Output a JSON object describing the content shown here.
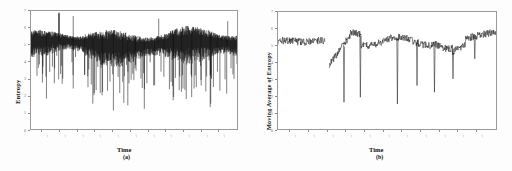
{
  "figure": {
    "background_color": "#ffffff",
    "line_color": "#101010",
    "frame_color": "#9a9a9a"
  },
  "panels": [
    {
      "id": "a",
      "caption": "(a)",
      "xlabel": "Time",
      "ylabel": "Entropy"
    },
    {
      "id": "b",
      "caption": "(b)",
      "xlabel": "Time",
      "ylabel": "Moving Average of Entropy"
    }
  ],
  "chart_data": [
    {
      "type": "line",
      "title": "",
      "panel": "(a)",
      "xlabel": "Time",
      "ylabel": "Entropy",
      "xlim": [
        0,
        1000
      ],
      "ylim": [
        0,
        7
      ],
      "yticks": [
        0,
        1,
        2,
        3,
        4,
        5,
        6,
        7
      ],
      "ytick_labels": [
        "0",
        "1",
        "2",
        "3",
        "4",
        "5",
        "6",
        "7"
      ],
      "xticks": [
        55,
        140,
        225,
        310,
        395,
        480,
        565,
        650,
        735,
        820,
        905
      ],
      "xtick_labels": [
        "",
        "",
        "",
        "",
        "",
        "",
        "",
        "",
        "",
        "",
        ""
      ],
      "grid": false,
      "legend": null,
      "description": "Dense high-frequency entropy signal, mean near 5.0, with many deep downward spikes reaching 1-3; noise band widens after x~220",
      "series": [
        {
          "name": "Entropy",
          "baseline": 5.05,
          "noise_amplitude": 0.55,
          "color": "#101010"
        }
      ],
      "spike_positions": [
        0.075,
        0.135,
        0.205,
        0.26,
        0.3,
        0.345,
        0.4,
        0.445,
        0.47,
        0.505,
        0.55,
        0.6,
        0.645,
        0.69,
        0.73,
        0.78,
        0.825,
        0.87,
        0.905,
        0.95
      ],
      "spike_depths": [
        1.8,
        6.4,
        2.4,
        3.2,
        1.5,
        2.0,
        1.1,
        2.8,
        1.4,
        3.6,
        1.2,
        2.6,
        3.1,
        1.7,
        2.2,
        1.9,
        2.9,
        1.3,
        3.4,
        2.1
      ]
    },
    {
      "type": "line",
      "title": "",
      "panel": "(b)",
      "xlabel": "Time",
      "ylabel": "Moving Average of Entropy",
      "xlim": [
        0,
        1000
      ],
      "ylim": [
        0,
        7
      ],
      "yticks": [
        0,
        1,
        2,
        3,
        4,
        5,
        6,
        7
      ],
      "ytick_labels": [
        "0",
        "1",
        "2",
        "3",
        "4",
        "5",
        "6",
        "7"
      ],
      "xticks": [
        55,
        140,
        225,
        310,
        395,
        480,
        565,
        650,
        735,
        820,
        905
      ],
      "xtick_labels": [
        "",
        "",
        "",
        "",
        "",
        "",
        "",
        "",
        "",
        "",
        ""
      ],
      "grid": false,
      "legend": null,
      "description": "Smoothed moving-average trace near 5.2, flat at left, a gap then a dip to 3.8 and a rise to 5.8, jagged mid-section with several very deep narrow drops to 1.5-2.5, rising to 6.0 at right",
      "series": [
        {
          "name": "Moving Average of Entropy",
          "baseline": 5.2,
          "noise_amplitude": 0.22,
          "color": "#101010"
        }
      ],
      "spike_positions": [
        0.3,
        0.375,
        0.545,
        0.635,
        0.715,
        0.8,
        0.9
      ],
      "spike_depths": [
        1.6,
        1.9,
        1.5,
        2.6,
        2.2,
        3.0,
        4.2
      ]
    }
  ]
}
